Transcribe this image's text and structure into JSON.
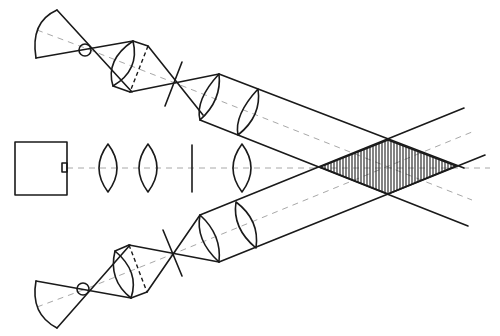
{
  "diagram": {
    "type": "optical-schematic",
    "colors": {
      "line": "#1a1a1a",
      "axis": "#a8a8a8",
      "background": "#ffffff"
    },
    "components": {
      "source_box": {
        "label": "",
        "x": 15,
        "y": 142,
        "w": 52,
        "h": 53,
        "port": {
          "x": 62,
          "y": 163,
          "w": 5,
          "h": 9
        }
      },
      "center_lenses": [
        {
          "cx": 108,
          "cy": 168,
          "rx": 11,
          "ry": 24
        },
        {
          "cx": 148,
          "cy": 168,
          "rx": 11,
          "ry": 24
        },
        {
          "cx": 242,
          "cy": 168,
          "rx": 11,
          "ry": 24
        }
      ],
      "center_stop": {
        "x": 192,
        "y1": 145,
        "y2": 192
      },
      "overlap_region": {
        "left": [
          320,
          167
        ],
        "top": [
          388,
          140
        ],
        "right": [
          456,
          166
        ],
        "bottom": [
          388,
          194
        ],
        "hatch": "vertical"
      },
      "upper_path": {
        "pinhole": [
          85,
          48
        ],
        "cross_stop": [
          175,
          83
        ]
      },
      "lower_path": {
        "pinhole": [
          83,
          290
        ],
        "cross_stop": [
          173,
          254
        ]
      }
    }
  }
}
